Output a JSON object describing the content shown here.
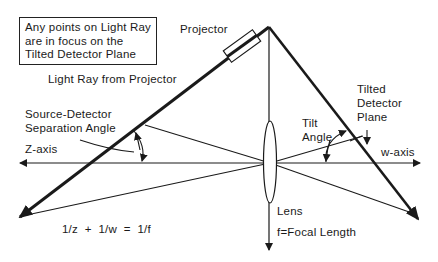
{
  "diagram": {
    "note": {
      "lines": [
        "Any points on Light Ray",
        "are in focus on the",
        "Tilted Detector Plane"
      ]
    },
    "labels": {
      "projector": "Projector",
      "light_ray": "Light Ray from Projector",
      "source_detector_1": "Source-Detector",
      "source_detector_2": "Separation Angle",
      "z_axis": "Z-axis",
      "w_axis": "w-axis",
      "tilt_1": "Tilt",
      "tilt_2": "Angle",
      "tilted_1": "Tilted",
      "tilted_2": "Detector",
      "tilted_3": "Plane",
      "lens": "Lens",
      "focal": "f=Focal Length",
      "equation": "1/z  +  1/w  =  1/f"
    },
    "colors": {
      "ink": "#1a1a1a",
      "background": "#ffffff"
    }
  }
}
